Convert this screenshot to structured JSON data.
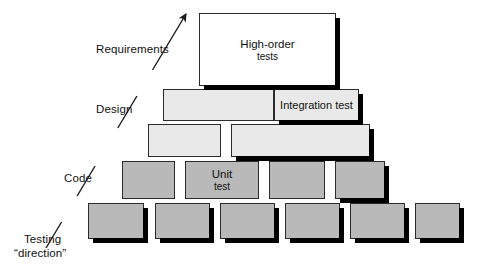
{
  "diagram": {
    "colors": {
      "white_block": "#ffffff",
      "light_gray_block": "#e9e9e9",
      "mid_gray_block": "#b9b9b9",
      "outline": "#2b2b2b",
      "shadow": "#000000",
      "text": "#111111"
    },
    "side_labels": [
      {
        "id": "requirements",
        "text": "Requirements",
        "x": 96,
        "y": 43
      },
      {
        "id": "design",
        "text": "Design",
        "x": 96,
        "y": 103
      },
      {
        "id": "code",
        "text": "Code",
        "x": 64,
        "y": 172
      },
      {
        "id": "testing-direction-line1",
        "text": "Testing",
        "x": 24,
        "y": 233
      },
      {
        "id": "testing-direction-line2",
        "text": "“direction”",
        "x": 14,
        "y": 247
      }
    ],
    "arrow": {
      "name": "testing-direction-arrow",
      "from_x": 46,
      "from_y": 248,
      "to_x": 186,
      "to_y": 14,
      "gap_top_y": 70,
      "gap_bottom_y": 96,
      "gap2_top_y": 128,
      "gap2_bottom_y": 166,
      "gap3_top_y": 196,
      "gap3_bottom_y": 222,
      "color": "#1a1a1a"
    },
    "tiers": [
      {
        "name": "tier-high-order-tests",
        "level": 1,
        "fill": "#ffffff",
        "y": 13,
        "height": 73,
        "blocks": [
          {
            "id": "high-order-tests",
            "x": 199,
            "w": 137,
            "label_line1": "High-order",
            "label_line2": "tests",
            "shadow": true
          }
        ]
      },
      {
        "name": "tier-integration-test",
        "level": 2,
        "fill": "#e9e9e9",
        "y": 89,
        "height": 32,
        "blocks": [
          {
            "id": "tier2-block-1",
            "x": 163,
            "w": 111,
            "label_line1": "",
            "label_line2": "",
            "shadow": false
          },
          {
            "id": "integration-test",
            "x": 274,
            "w": 85,
            "label_line1": "Integration test",
            "label_line2": "",
            "shadow": true
          }
        ]
      },
      {
        "name": "tier-design-lower",
        "level": 3,
        "fill": "#e9e9e9",
        "y": 124,
        "height": 33,
        "blocks": [
          {
            "id": "tier3-block-1",
            "x": 148,
            "w": 73,
            "label_line1": "",
            "label_line2": "",
            "shadow": false
          },
          {
            "id": "tier3-block-2",
            "x": 231,
            "w": 139,
            "label_line1": "",
            "label_line2": "",
            "shadow": true
          }
        ]
      },
      {
        "name": "tier-unit-test",
        "level": 4,
        "fill": "#b9b9b9",
        "y": 161,
        "height": 38,
        "blocks": [
          {
            "id": "tier4-block-1",
            "x": 122,
            "w": 53,
            "label_line1": "",
            "label_line2": "",
            "shadow": false
          },
          {
            "id": "unit-test",
            "x": 185,
            "w": 74,
            "label_line1": "Unit",
            "label_line2": "test",
            "shadow": false
          },
          {
            "id": "tier4-block-3",
            "x": 269,
            "w": 56,
            "label_line1": "",
            "label_line2": "",
            "shadow": false
          },
          {
            "id": "tier4-block-4",
            "x": 335,
            "w": 50,
            "label_line1": "",
            "label_line2": "",
            "shadow": true
          }
        ]
      },
      {
        "name": "tier-code-base",
        "level": 5,
        "fill": "#b9b9b9",
        "y": 203,
        "height": 36,
        "blocks": [
          {
            "id": "tier5-block-1",
            "x": 88,
            "w": 56,
            "label_line1": "",
            "label_line2": "",
            "shadow": true
          },
          {
            "id": "tier5-block-2",
            "x": 155,
            "w": 55,
            "label_line1": "",
            "label_line2": "",
            "shadow": true
          },
          {
            "id": "tier5-block-3",
            "x": 220,
            "w": 55,
            "label_line1": "",
            "label_line2": "",
            "shadow": true
          },
          {
            "id": "tier5-block-4",
            "x": 285,
            "w": 55,
            "label_line1": "",
            "label_line2": "",
            "shadow": true
          },
          {
            "id": "tier5-block-5",
            "x": 350,
            "w": 55,
            "label_line1": "",
            "label_line2": "",
            "shadow": true
          },
          {
            "id": "tier5-block-6",
            "x": 415,
            "w": 45,
            "label_line1": "",
            "label_line2": "",
            "shadow": true
          }
        ]
      }
    ]
  }
}
